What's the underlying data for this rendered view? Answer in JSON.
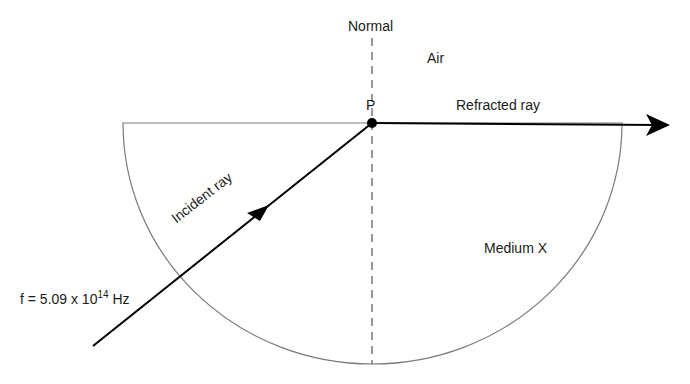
{
  "diagram": {
    "labels": {
      "normal": "Normal",
      "air": "Air",
      "point": "P",
      "refracted_ray": "Refracted ray",
      "incident_ray": "Incident ray",
      "medium": "Medium X",
      "frequency_prefix": "f = 5.09 x 10",
      "frequency_exponent": "14",
      "frequency_unit": " Hz"
    },
    "colors": {
      "ray": "#000000",
      "outline": "#777777",
      "normal_line": "#555555"
    }
  }
}
